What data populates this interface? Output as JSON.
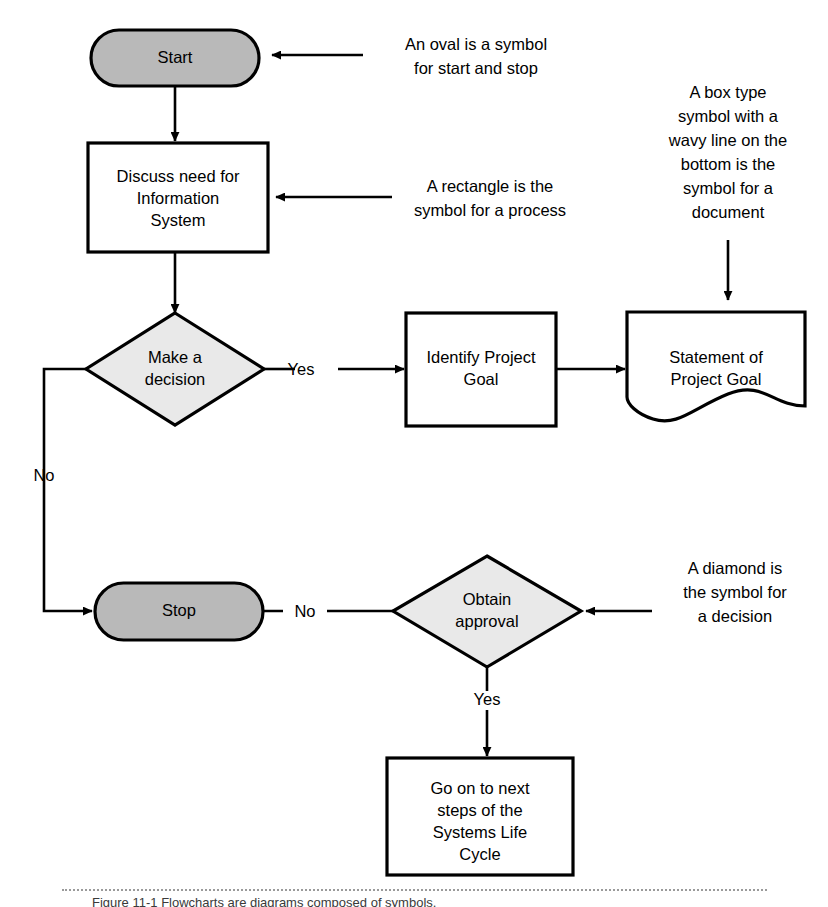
{
  "diagram": {
    "background_color": "#ffffff",
    "line_color": "#000000",
    "terminator_fill": "#b9b9b9",
    "decision_fill": "#e9e9e9",
    "process_fill": "#ffffff",
    "nodes": {
      "start": {
        "label": "Start",
        "shape": "oval-terminator"
      },
      "discuss": {
        "line1": "Discuss need for",
        "line2": "Information",
        "line3": "System",
        "shape": "rectangle-process"
      },
      "make_decision": {
        "line1": "Make a",
        "line2": "decision",
        "shape": "diamond-decision"
      },
      "identify_goal": {
        "line1": "Identify Project",
        "line2": "Goal",
        "shape": "rectangle-process"
      },
      "statement_goal": {
        "line1": "Statement of",
        "line2": "Project Goal",
        "shape": "document"
      },
      "stop": {
        "label": "Stop",
        "shape": "oval-terminator"
      },
      "obtain_approval": {
        "line1": "Obtain",
        "line2": "approval",
        "shape": "diamond-decision"
      },
      "next_steps": {
        "line1": "Go on to next",
        "line2": "steps of the",
        "line3": "Systems Life",
        "line4": "Cycle",
        "shape": "rectangle-process"
      }
    },
    "edge_labels": {
      "decision_yes": "Yes",
      "decision_no": "No",
      "approval_no": "No",
      "approval_yes": "Yes"
    },
    "annotations": {
      "oval": {
        "line1": "An oval is a symbol",
        "line2": "for start and stop"
      },
      "rectangle": {
        "line1": "A rectangle is the",
        "line2": "symbol for a process"
      },
      "document": {
        "line1": "A box type",
        "line2": "symbol with a",
        "line3": "wavy line on the",
        "line4": "bottom is the",
        "line5": "symbol for a",
        "line6": "document"
      },
      "diamond": {
        "line1": "A diamond is",
        "line2": "the symbol for",
        "line3": "a decision"
      }
    },
    "caption": {
      "text": "Figure 11-1 Flowcharts are diagrams composed of symbols."
    }
  }
}
